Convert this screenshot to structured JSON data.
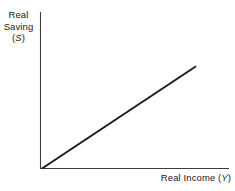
{
  "figure": {
    "background_color": "#ffffff",
    "width": 235,
    "height": 191
  },
  "axes": {
    "y_label_line1": "Real",
    "y_label_line2": "Saving",
    "y_label_symbol_open": "(",
    "y_label_symbol": "S",
    "y_label_symbol_close": ")",
    "x_label_text": "Real Income ",
    "x_label_symbol_open": "(",
    "x_label_symbol": "Y",
    "x_label_symbol_close": ")",
    "axis_color": "#3d3d3d",
    "line_color": "#1c1c1c"
  },
  "chart_data": {
    "type": "line",
    "title": "",
    "xlabel": "Real Income (Y)",
    "ylabel": "Real Saving (S)",
    "grid": false,
    "legend": "none",
    "xlim": [
      0,
      100
    ],
    "ylim": [
      0,
      100
    ],
    "x_tick_labels": [],
    "y_tick_labels": [],
    "series": [
      {
        "name": "Saving function",
        "x": [
          0,
          100
        ],
        "values": [
          0,
          66
        ],
        "style": "solid",
        "color": "#1c1c1c",
        "width": 2
      }
    ],
    "annotations": []
  }
}
